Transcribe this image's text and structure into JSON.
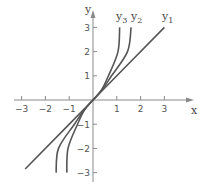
{
  "chart_data": {
    "type": "line",
    "title": "",
    "xlabel": "x",
    "ylabel": "y",
    "xlim": [
      -3,
      3
    ],
    "ylim": [
      -3,
      3
    ],
    "grid": false,
    "legend": "inline labels at top of curves",
    "x_ticks": [
      "-3",
      "-2",
      "-1",
      "1",
      "2",
      "3"
    ],
    "y_ticks": [
      "3",
      "2",
      "1",
      "-1",
      "-2",
      "-3"
    ],
    "series": [
      {
        "name": "y1",
        "label_base": "y",
        "label_sub": "1",
        "x": [
          -2.85,
          0,
          3.0
        ],
        "y": [
          -2.85,
          0,
          3.0
        ]
      },
      {
        "name": "y2",
        "label_base": "y",
        "label_sub": "2",
        "x": [
          -1.55,
          -1.45,
          -0.78,
          -0.4,
          0,
          0.4,
          0.78,
          1.45,
          1.6
        ],
        "y": [
          -3,
          -2,
          -1,
          -0.45,
          0,
          0.45,
          1,
          2,
          3
        ]
      },
      {
        "name": "y3",
        "label_base": "y",
        "label_sub": "3",
        "x": [
          -1.1,
          -1.05,
          -0.65,
          -0.35,
          0,
          0.35,
          0.65,
          1.05,
          1.12
        ],
        "y": [
          -3,
          -2,
          -1,
          -0.4,
          0,
          0.4,
          1,
          2,
          3
        ]
      }
    ]
  },
  "axes": {
    "x_label": "x",
    "y_label": "y"
  }
}
